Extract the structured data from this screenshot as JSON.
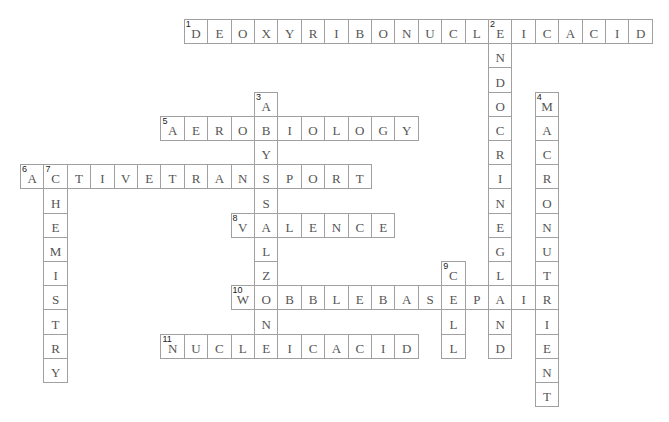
{
  "puzzle": {
    "grid": {
      "x0": 20,
      "y0": 19,
      "cell_w": 23.4,
      "cell_h": 24.2
    },
    "colors": {
      "border": "#a0a0a0",
      "letter": "#555555",
      "number": "#222222",
      "background": "#ffffff"
    },
    "entries": [
      {
        "number": 1,
        "direction": "across",
        "answer": "DEOXYRIBONUCLEICACID",
        "row": 0,
        "col": 7
      },
      {
        "number": 2,
        "direction": "down",
        "answer": "ENDOCRINEGLAND",
        "row": 0,
        "col": 20
      },
      {
        "number": 3,
        "direction": "down",
        "answer": "ABYSSALZONE",
        "row": 3,
        "col": 10
      },
      {
        "number": 4,
        "direction": "down",
        "answer": "MACRONUTRIENT",
        "row": 3,
        "col": 22
      },
      {
        "number": 5,
        "direction": "across",
        "answer": "AEROBIOLOGY",
        "row": 4,
        "col": 6
      },
      {
        "number": 6,
        "direction": "across",
        "answer": "ACTIVETRANSPORT",
        "row": 6,
        "col": 0
      },
      {
        "number": 7,
        "direction": "down",
        "answer": "CHEMISTRY",
        "row": 6,
        "col": 1
      },
      {
        "number": 8,
        "direction": "across",
        "answer": "VALENCE",
        "row": 8,
        "col": 9
      },
      {
        "number": 9,
        "direction": "down",
        "answer": "CELL",
        "row": 10,
        "col": 18
      },
      {
        "number": 10,
        "direction": "across",
        "answer": "WOBBLEBASEPAIR",
        "row": 11,
        "col": 9
      },
      {
        "number": 11,
        "direction": "across",
        "answer": "NUCLEICACID",
        "row": 13,
        "col": 6
      }
    ]
  }
}
